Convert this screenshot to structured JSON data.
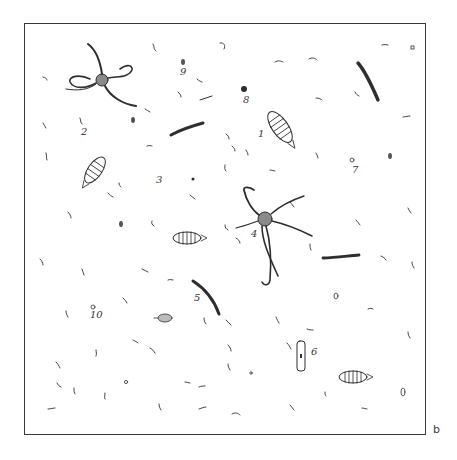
{
  "figure": {
    "panel_label": "b",
    "frame": {
      "left": 24,
      "top": 23,
      "right": 426,
      "bottom": 435
    },
    "colors": {
      "ink": "#2e2e2e",
      "background": "#ffffff",
      "frame": "#3a3a3a"
    },
    "labels": [
      {
        "id": "label-1",
        "text": "1",
        "x": 258,
        "y": 137
      },
      {
        "id": "label-2",
        "text": "2",
        "x": 81,
        "y": 135
      },
      {
        "id": "label-3",
        "text": "3",
        "x": 156,
        "y": 183
      },
      {
        "id": "label-4",
        "text": "4",
        "x": 251,
        "y": 237
      },
      {
        "id": "label-5",
        "text": "5",
        "x": 194,
        "y": 301
      },
      {
        "id": "label-6",
        "text": "6",
        "x": 311,
        "y": 355
      },
      {
        "id": "label-7",
        "text": "7",
        "x": 352,
        "y": 173
      },
      {
        "id": "label-8",
        "text": "8",
        "x": 243,
        "y": 103
      },
      {
        "id": "label-9",
        "text": "9",
        "x": 180,
        "y": 75
      },
      {
        "id": "label-10",
        "text": "10",
        "x": 90,
        "y": 318
      }
    ],
    "organisms": [
      {
        "type": "brittle-star",
        "label": "2",
        "cx": 102,
        "cy": 80
      },
      {
        "type": "brittle-star",
        "label": "4",
        "cx": 265,
        "cy": 219
      },
      {
        "type": "segmented-larva",
        "label": "1",
        "cx": 280,
        "cy": 127
      },
      {
        "type": "segmented-larva",
        "cx": 95,
        "cy": 170
      },
      {
        "type": "segmented-larva",
        "cx": 187,
        "cy": 238
      },
      {
        "type": "segmented-larva",
        "cx": 353,
        "cy": 377
      },
      {
        "type": "segmented-larva-small",
        "cx": 165,
        "cy": 318
      },
      {
        "type": "spine",
        "label": "5",
        "cx": 207,
        "cy": 298
      },
      {
        "type": "spine",
        "cx": 190,
        "cy": 130
      },
      {
        "type": "spine",
        "cx": 368,
        "cy": 83
      },
      {
        "type": "spine",
        "cx": 340,
        "cy": 257
      },
      {
        "type": "tube-cell",
        "label": "6",
        "cx": 301,
        "cy": 356
      },
      {
        "type": "dot",
        "label": "8",
        "cx": 244,
        "cy": 89
      },
      {
        "type": "ring",
        "label": "7",
        "cx": 352,
        "cy": 160
      },
      {
        "type": "ring",
        "label": "10",
        "cx": 93,
        "cy": 307
      },
      {
        "type": "seed",
        "label": "9",
        "cx": 183,
        "cy": 62
      }
    ]
  }
}
